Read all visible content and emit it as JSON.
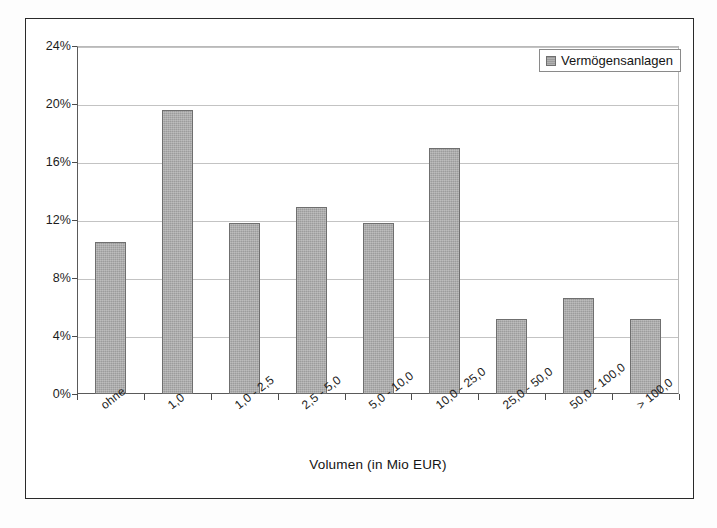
{
  "chart_data": {
    "type": "bar",
    "title": "",
    "xlabel": "Volumen (in Mio EUR)",
    "ylabel": "",
    "categories": [
      "ohne",
      "1,0",
      "1,0 - 2,5",
      "2,5 - 5,0",
      "5,0 - 10,0",
      "10,0 - 25,0",
      "25,0 - 50,0",
      "50,0 - 100,0",
      "> 100,0"
    ],
    "series": [
      {
        "name": "Vermögensanlagen",
        "values": [
          10.5,
          19.6,
          11.8,
          12.9,
          11.8,
          17.0,
          5.2,
          6.6,
          5.2
        ]
      }
    ],
    "ylim": [
      0,
      24
    ],
    "ytick_labels": [
      "0%",
      "4%",
      "8%",
      "12%",
      "16%",
      "20%",
      "24%"
    ],
    "ytick_values": [
      0,
      4,
      8,
      12,
      16,
      20,
      24
    ],
    "grid": true,
    "legend_position": "top-right",
    "value_suffix": "%",
    "colors": {
      "bar_fill": "#9c9c9c",
      "bar_border": "#6f6f6f",
      "gridline": "#c3c3c3",
      "axis": "#4c4c4c",
      "frame": "#2a2a2a",
      "text": "#141414",
      "background": "#ffffff"
    }
  },
  "legend": {
    "entries": [
      {
        "label": "Vermögensanlagen",
        "swatch_name": "legend-swatch-vermoegensanlagen"
      }
    ]
  },
  "axes": {
    "x_title": "Volumen (in Mio EUR)"
  }
}
